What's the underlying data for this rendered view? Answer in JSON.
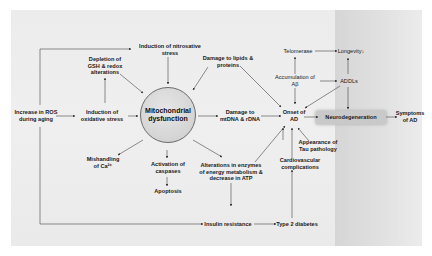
{
  "diagram": {
    "central_node": "Mitochondrial\ndysfunction",
    "nodes": {
      "ros": "Increase in ROS\nduring aging",
      "oxidative": "Induction of\noxidative stress",
      "gsh": "Depletion of\nGSH & redox\nalterations",
      "nitrosative": "Induction of nitrosative\nstress",
      "lipids": "Damage to lipids &\nproteins",
      "mtdna": "Damage to\nmtDNA & rDNA",
      "calcium": "Mishandling\nof Ca²⁺",
      "caspases": "Activation of\ncaspases",
      "apoptosis": "Apoptosis",
      "enzymes": "Alterations in enzymes\nof energy metabolism &\ndecrease in ATP",
      "insulin": "Insulin resistance",
      "diabetes": "Type 2 diabetes",
      "cardio": "Cardiovascular\ncomplications",
      "tau": "Appearance of\nTau pathology",
      "onset": "Onset of\nAD",
      "telomerase": "Telomerase",
      "longevity": "Longevity↓",
      "abeta": "Accumulation of\nAβ",
      "addls": "ADDLs",
      "neuro": "Neurodegeneration",
      "symptoms": "Symptoms\nof AD"
    },
    "colors": {
      "panel": "#ececec",
      "band": "#d9d9d9",
      "circle": "#d4d4d4",
      "highlight": "#c9c9c9",
      "line": "#3a3a3a"
    }
  }
}
